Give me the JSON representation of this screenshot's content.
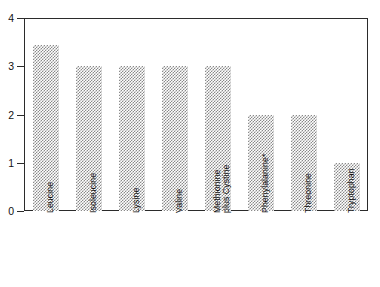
{
  "chart_data": {
    "type": "bar",
    "title": "",
    "subtitle": "",
    "xlabel": "",
    "ylabel": "",
    "categories": [
      "Leucine",
      "Isoleucine",
      "Lysine",
      "Valine",
      "Methionine plus Cystine",
      "Phenylalanine*",
      "Threonine",
      "Tryptophan"
    ],
    "category_lines": [
      [
        "Leucine"
      ],
      [
        "Isoleucine"
      ],
      [
        "Lysine"
      ],
      [
        "Valine"
      ],
      [
        "Methionine",
        "plus Cystine"
      ],
      [
        "Phenylalanine*"
      ],
      [
        "Threonine"
      ],
      [
        "Tryptophan"
      ]
    ],
    "values": [
      3.45,
      3.0,
      3.0,
      3.0,
      3.0,
      2.0,
      2.0,
      1.0
    ],
    "ylim": [
      0,
      4
    ],
    "yticks": [
      0,
      1,
      2,
      3,
      4
    ],
    "ytick_labels": [
      "0",
      "1",
      "2",
      "3",
      "4"
    ],
    "grid": true,
    "grid_axis": "y",
    "legend": false,
    "legend_position": "none",
    "bar_fill": "hatch-checker",
    "bar_color": "#8a8a8a",
    "frame_color": "#2b2b2b",
    "background": "#ffffff"
  },
  "axes": {
    "y_tick_0": "0",
    "y_tick_1": "1",
    "y_tick_2": "2",
    "y_tick_3": "3",
    "y_tick_4": "4"
  }
}
